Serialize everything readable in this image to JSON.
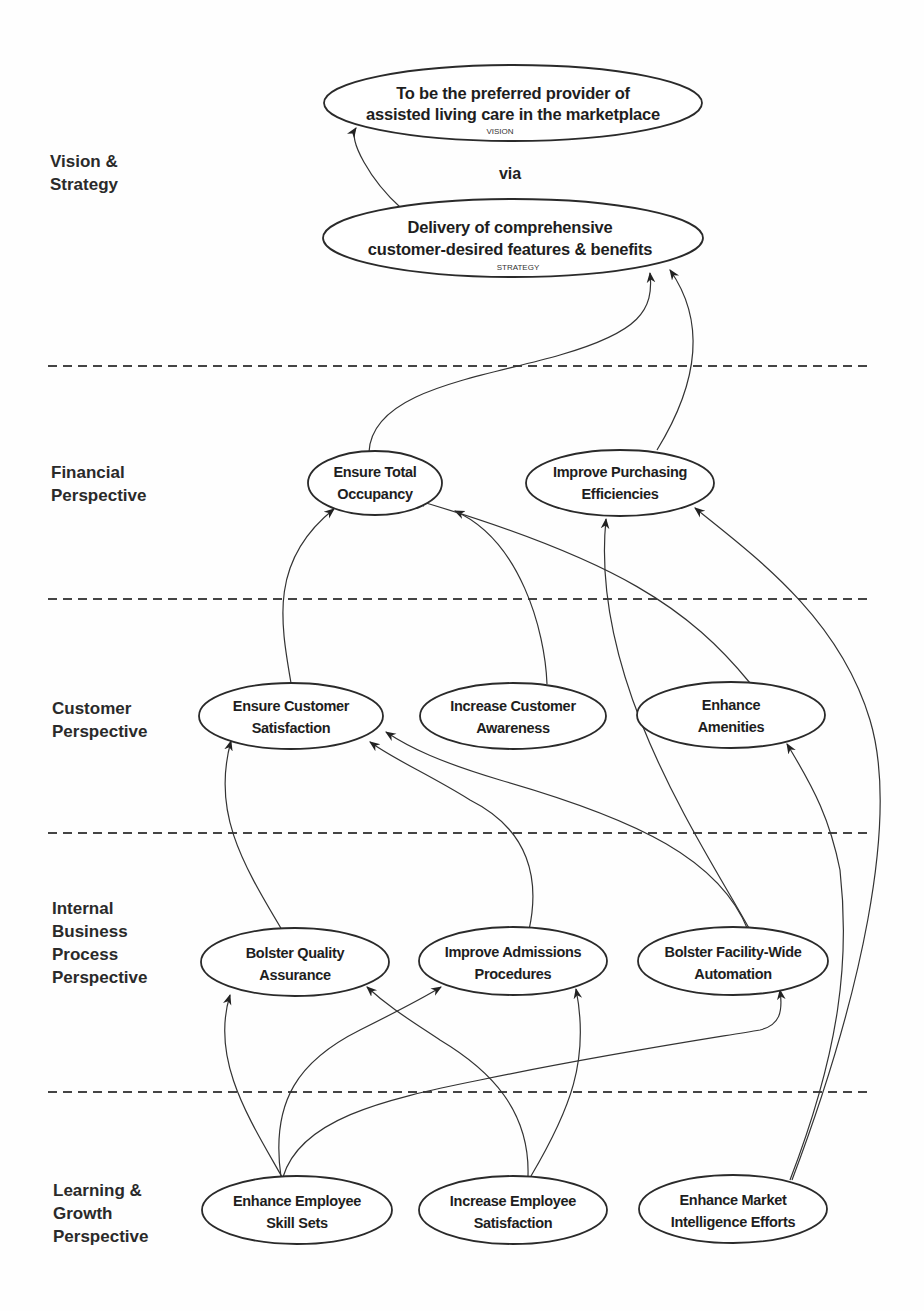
{
  "diagram": {
    "type": "balanced-scorecard-strategy-map",
    "rows": [
      {
        "id": "vision_strategy",
        "label_lines": [
          "Vision &",
          "Strategy"
        ]
      },
      {
        "id": "financial",
        "label_lines": [
          "Financial",
          "Perspective"
        ]
      },
      {
        "id": "customer",
        "label_lines": [
          "Customer",
          "Perspective"
        ]
      },
      {
        "id": "internal",
        "label_lines": [
          "Internal",
          "Business",
          "Process",
          "Perspective"
        ]
      },
      {
        "id": "learning",
        "label_lines": [
          "Learning &",
          "Growth",
          "Perspective"
        ]
      }
    ],
    "connector_text": "via",
    "nodes": {
      "vision": {
        "lines": [
          "To be the preferred provider of",
          "assisted living care in the marketplace"
        ],
        "tag": "VISION"
      },
      "strategy": {
        "lines": [
          "Delivery of comprehensive",
          "customer-desired features & benefits"
        ],
        "tag": "STRATEGY"
      },
      "total_occupancy": {
        "lines": [
          "Ensure Total",
          "Occupancy"
        ]
      },
      "purchasing": {
        "lines": [
          "Improve Purchasing",
          "Efficiencies"
        ]
      },
      "cust_satisfaction": {
        "lines": [
          "Ensure Customer",
          "Satisfaction"
        ]
      },
      "cust_awareness": {
        "lines": [
          "Increase Customer",
          "Awareness"
        ]
      },
      "amenities": {
        "lines": [
          "Enhance",
          "Amenities"
        ]
      },
      "quality_assurance": {
        "lines": [
          "Bolster Quality",
          "Assurance"
        ]
      },
      "admissions": {
        "lines": [
          "Improve Admissions",
          "Procedures"
        ]
      },
      "automation": {
        "lines": [
          "Bolster Facility-Wide",
          "Automation"
        ]
      },
      "skill_sets": {
        "lines": [
          "Enhance Employee",
          "Skill Sets"
        ]
      },
      "emp_satisfaction": {
        "lines": [
          "Increase Employee",
          "Satisfaction"
        ]
      },
      "market_intel": {
        "lines": [
          "Enhance Market",
          "Intelligence Efforts"
        ]
      }
    },
    "edges": [
      {
        "from": "strategy",
        "to": "vision"
      },
      {
        "from": "total_occupancy",
        "to": "strategy"
      },
      {
        "from": "purchasing",
        "to": "strategy"
      },
      {
        "from": "cust_satisfaction",
        "to": "total_occupancy"
      },
      {
        "from": "cust_awareness",
        "to": "total_occupancy"
      },
      {
        "from": "amenities",
        "to": "total_occupancy"
      },
      {
        "from": "automation",
        "to": "purchasing"
      },
      {
        "from": "market_intel",
        "to": "purchasing"
      },
      {
        "from": "quality_assurance",
        "to": "cust_satisfaction"
      },
      {
        "from": "admissions",
        "to": "cust_satisfaction"
      },
      {
        "from": "automation",
        "to": "cust_satisfaction"
      },
      {
        "from": "market_intel",
        "to": "amenities"
      },
      {
        "from": "skill_sets",
        "to": "quality_assurance"
      },
      {
        "from": "skill_sets",
        "to": "admissions"
      },
      {
        "from": "skill_sets",
        "to": "automation"
      },
      {
        "from": "emp_satisfaction",
        "to": "quality_assurance"
      },
      {
        "from": "emp_satisfaction",
        "to": "admissions"
      }
    ]
  }
}
